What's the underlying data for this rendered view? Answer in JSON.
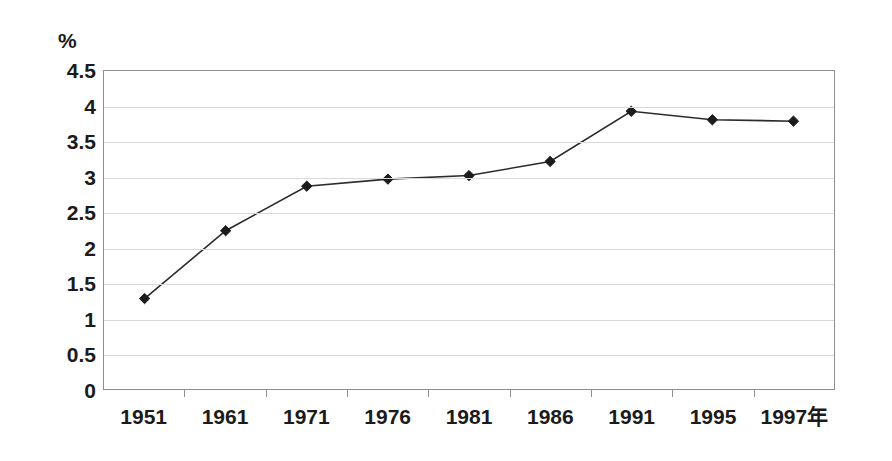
{
  "chart_data": {
    "type": "line",
    "title": "",
    "subtitle": "",
    "xlabel": "",
    "ylabel": "%",
    "unit_label": "%",
    "x_axis_suffix": "年",
    "categories": [
      "1951",
      "1961",
      "1971",
      "1976",
      "1981",
      "1986",
      "1991",
      "1995",
      "1997年"
    ],
    "values": [
      1.28,
      2.24,
      2.87,
      2.97,
      3.02,
      3.22,
      3.93,
      3.81,
      3.79
    ],
    "series": [
      {
        "name": "",
        "values": [
          1.28,
          2.24,
          2.87,
          2.97,
          3.02,
          3.22,
          3.93,
          3.81,
          3.79
        ]
      }
    ],
    "ylim": [
      0,
      4.5
    ],
    "ytick_step": 0.5,
    "yticks": [
      "4.5",
      "4",
      "3.5",
      "3",
      "2.5",
      "2",
      "1.5",
      "1",
      "0.5",
      "0"
    ],
    "ytick_values": [
      4.5,
      4,
      3.5,
      3,
      2.5,
      2,
      1.5,
      1,
      0.5,
      0
    ],
    "grid": true,
    "grid_axis": "y",
    "legend": false,
    "legend_position": "none",
    "marker": "diamond",
    "line_color": "#2b2b2b",
    "marker_color": "#1b1b1b",
    "grid_color": "#d8d8d8",
    "axis_color": "#8e8e8e",
    "background_color": "#ffffff",
    "annotations": []
  }
}
